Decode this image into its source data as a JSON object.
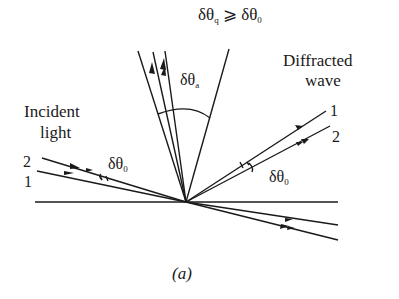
{
  "title_relation": {
    "lhs": "δθ",
    "lhs_sub": "q",
    "op": "⩾",
    "rhs": "δθ",
    "rhs_sub": "0"
  },
  "labels": {
    "incident_line1": "Incident",
    "incident_line2": "light",
    "diffracted_line1": "Diffracted",
    "diffracted_line2": "wave",
    "cone_angle": "δθ",
    "cone_angle_sub": "a",
    "incident_angle": "δθ",
    "incident_angle_sub": "0",
    "diffracted_angle": "δθ",
    "diffracted_angle_sub": "0",
    "ray_in_2": "2",
    "ray_in_1": "1",
    "ray_out_1": "1",
    "ray_out_2": "2",
    "caption": "(a)"
  },
  "colors": {
    "ink": "#1a1a1a",
    "background": "#ffffff"
  }
}
